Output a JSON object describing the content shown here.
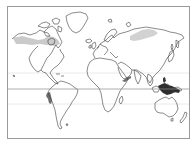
{
  "map": {
    "type": "world-outline-map",
    "projection": "cylindrical",
    "frame": {
      "x": 7,
      "y": 6,
      "width": 183,
      "height": 133,
      "stroke": "#9a9a9a"
    },
    "reference_lines": [
      {
        "name": "tropic-of-cancer",
        "y": 73,
        "color": "#e2e2e2"
      },
      {
        "name": "equator",
        "y": 89,
        "color": "#8a8a8a"
      },
      {
        "name": "tropic-of-capricorn",
        "y": 104,
        "color": "#e2e2e2"
      }
    ],
    "coastline_color": "#3a3a3a",
    "highlight_regions": [
      {
        "name": "northern-canada-alaska",
        "shade": "light",
        "color": "#c8c8c8"
      },
      {
        "name": "northern-siberia",
        "shade": "light",
        "color": "#cfcfcf"
      },
      {
        "name": "peru-coast",
        "shade": "dark",
        "color": "#6e6e6e"
      },
      {
        "name": "arabian-sea-oman",
        "shade": "dark",
        "color": "#6e6e6e"
      },
      {
        "name": "maritime-southeast-asia",
        "shade": "darkest",
        "color": "#2e2e2e"
      }
    ]
  }
}
